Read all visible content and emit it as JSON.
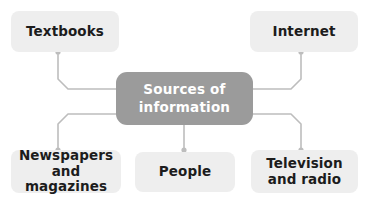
{
  "diagram": {
    "type": "mind-map",
    "title": "Sources of information",
    "background_color": "#ffffff",
    "center": {
      "id": "center",
      "label": "Sources of\ninformation",
      "fill_color": "#9b9b9b",
      "text_color": "#ffffff"
    },
    "connector": {
      "line_color": "#bdbdbd",
      "dot_color": "#bdbdbd"
    },
    "node_style": {
      "fill_color": "#eeeeee",
      "text_color": "#1c1c1c"
    },
    "nodes": [
      {
        "id": "textbooks",
        "label": "Textbooks",
        "position": "top-left"
      },
      {
        "id": "internet",
        "label": "Internet",
        "position": "top-right"
      },
      {
        "id": "newspapers",
        "label": "Newspapers\nand magazines",
        "position": "bottom-left"
      },
      {
        "id": "people",
        "label": "People",
        "position": "bottom-center"
      },
      {
        "id": "television",
        "label": "Television\nand radio",
        "position": "bottom-right"
      }
    ],
    "edges": [
      {
        "from": "center",
        "to": "textbooks"
      },
      {
        "from": "center",
        "to": "internet"
      },
      {
        "from": "center",
        "to": "newspapers"
      },
      {
        "from": "center",
        "to": "people"
      },
      {
        "from": "center",
        "to": "television"
      }
    ]
  }
}
